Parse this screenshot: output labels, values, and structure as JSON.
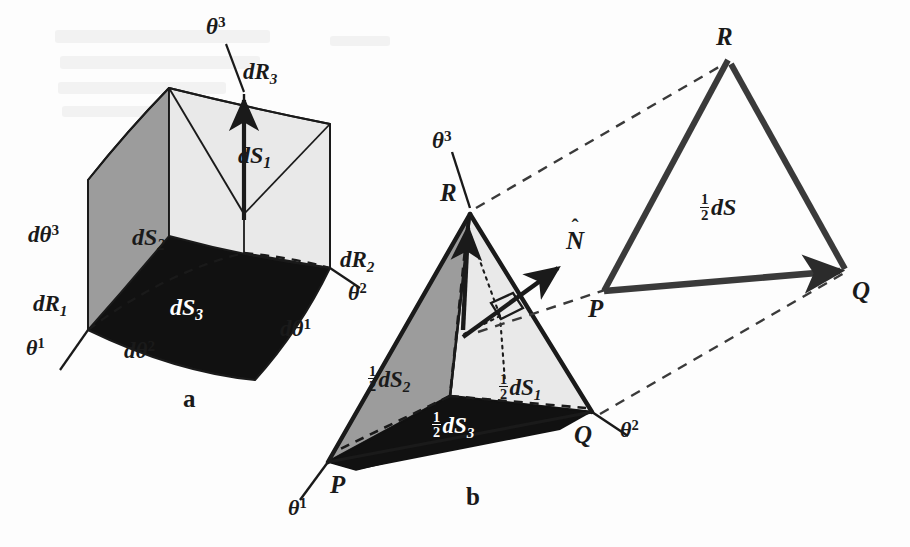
{
  "figure": {
    "colors": {
      "ink": "#1a1a1a",
      "face_light": "#e9e9e9",
      "face_mid": "#9c9c9c",
      "face_dark": "#111111",
      "background": "#fdfdfd"
    }
  },
  "panel_a": {
    "caption": "a",
    "axes": [
      {
        "name": "theta3",
        "base": "θ",
        "exp": "3"
      },
      {
        "name": "theta1",
        "base": "θ",
        "exp": "1"
      },
      {
        "name": "theta2",
        "base": "θ",
        "exp": "2"
      }
    ],
    "edge_vectors": [
      {
        "name": "dR1",
        "base": "d",
        "sym": "R",
        "sub": "1"
      },
      {
        "name": "dR2",
        "base": "d",
        "sym": "R",
        "sub": "2"
      },
      {
        "name": "dR3",
        "base": "d",
        "sym": "R",
        "sub": "3"
      }
    ],
    "edge_increments": [
      {
        "name": "dtheta1",
        "base": "dθ",
        "exp": "1"
      },
      {
        "name": "dtheta2",
        "base": "dθ",
        "exp": "2"
      },
      {
        "name": "dtheta3",
        "base": "dθ",
        "exp": "3"
      }
    ],
    "faces": [
      {
        "name": "dS1",
        "base": "d",
        "sym": "S",
        "sub": "1",
        "shade": "light"
      },
      {
        "name": "dS2",
        "base": "d",
        "sym": "S",
        "sub": "2",
        "shade": "mid"
      },
      {
        "name": "dS3",
        "base": "d",
        "sym": "S",
        "sub": "3",
        "shade": "dark"
      }
    ]
  },
  "panel_b": {
    "caption": "b",
    "vertices": [
      {
        "name": "P",
        "label": "P"
      },
      {
        "name": "Q",
        "label": "Q"
      },
      {
        "name": "R",
        "label": "R"
      }
    ],
    "axes": [
      {
        "name": "theta3",
        "base": "θ",
        "exp": "3"
      },
      {
        "name": "theta1",
        "base": "θ",
        "exp": "1"
      },
      {
        "name": "theta2",
        "base": "θ",
        "exp": "2"
      }
    ],
    "normal": {
      "name": "N-hat",
      "sym": "N",
      "hat": "ˆ"
    },
    "faces": [
      {
        "name": "half-dS1",
        "num": "1",
        "den": "2",
        "base": "d",
        "sym": "S",
        "sub": "1",
        "shade": "light"
      },
      {
        "name": "half-dS2",
        "num": "1",
        "den": "2",
        "base": "d",
        "sym": "S",
        "sub": "2",
        "shade": "mid"
      },
      {
        "name": "half-dS3",
        "num": "1",
        "den": "2",
        "base": "d",
        "sym": "S",
        "sub": "3",
        "shade": "dark"
      }
    ],
    "right_angle_marker": "∎"
  },
  "panel_c": {
    "vertices": [
      {
        "name": "P",
        "label": "P"
      },
      {
        "name": "Q",
        "label": "Q"
      },
      {
        "name": "R",
        "label": "R"
      }
    ],
    "area": {
      "name": "half-dS",
      "num": "1",
      "den": "2",
      "base": "d",
      "sym": "S"
    }
  }
}
